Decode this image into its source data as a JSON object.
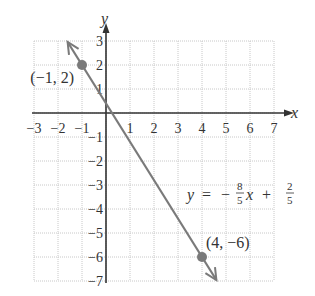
{
  "chart_data": {
    "type": "line",
    "title": "",
    "xlabel": "x",
    "ylabel": "y",
    "xlim": [
      -3,
      7
    ],
    "ylim": [
      -7,
      3
    ],
    "grid": true,
    "grid_style": "dotted",
    "x_ticks": [
      -3,
      -2,
      -1,
      1,
      2,
      3,
      4,
      5,
      6,
      7
    ],
    "y_ticks": [
      3,
      2,
      1,
      -1,
      -2,
      -3,
      -4,
      -5,
      -6,
      -7
    ],
    "x_tick_labels": [
      "−3",
      "−2",
      "−1",
      "1",
      "2",
      "3",
      "4",
      "5",
      "6",
      "7"
    ],
    "y_tick_labels": [
      "3",
      "2",
      "1",
      "−1",
      "−2",
      "−3",
      "−4",
      "−5",
      "−6",
      "−7"
    ],
    "series": [
      {
        "name": "y = -8/5 x + 2/5",
        "slope": -1.6,
        "intercept": 0.4,
        "x": [
          -1.6,
          4.6
        ],
        "y": [
          2.96,
          -6.96
        ],
        "color": "#7a7a7a",
        "arrows_both_ends": true
      }
    ],
    "points": [
      {
        "x": -1,
        "y": 2,
        "label": "(−1, 2)"
      },
      {
        "x": 4,
        "y": -6,
        "label": "(4, −6)"
      }
    ],
    "equation": {
      "lhs": "y",
      "eq": "=",
      "sign": "−",
      "coef_num": "8",
      "coef_den": "5",
      "var": "x",
      "plus": "+",
      "const_num": "2",
      "const_den": "5"
    },
    "colors": {
      "axis": "#333333",
      "grid": "#c8c8c8",
      "line": "#7a7a7a",
      "point": "#7a7a7a"
    }
  }
}
